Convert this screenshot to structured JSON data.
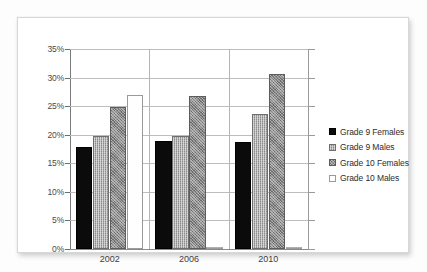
{
  "chart_data": {
    "type": "bar",
    "title": "",
    "xlabel": "",
    "ylabel": "",
    "categories": [
      "2002",
      "2006",
      "2010"
    ],
    "series": [
      {
        "name": "Grade 9 Females",
        "values": [
          17.9,
          18.9,
          18.8
        ],
        "color": "#0b0b0b",
        "swatch": "solid-black"
      },
      {
        "name": "Grade 9 Males",
        "values": [
          19.8,
          19.7,
          23.6
        ],
        "color": "#a9a9a9",
        "swatch": "medium-gray-dither"
      },
      {
        "name": "Grade 10 Females",
        "values": [
          24.8,
          26.8,
          30.7
        ],
        "color": "#8a8a8a",
        "swatch": "dark-gray-dither"
      },
      {
        "name": "Grade 10 Males",
        "values": [
          26.9,
          0.0,
          0.0
        ],
        "color": "#fefefe",
        "swatch": "white"
      }
    ],
    "ylim": [
      0,
      35
    ],
    "ytick_values": [
      0,
      5,
      10,
      15,
      20,
      25,
      30,
      35
    ],
    "ytick_labels": [
      "0%",
      "5%",
      "10%",
      "15%",
      "20%",
      "25%",
      "30%",
      "35%"
    ],
    "grid": true,
    "legend_position": "right",
    "value_suffix": "%"
  },
  "legend": {
    "items": [
      {
        "label": "Grade 9 Females"
      },
      {
        "label": "Grade 9 Males"
      },
      {
        "label": "Grade 10 Females"
      },
      {
        "label": "Grade 10 Males"
      }
    ]
  }
}
